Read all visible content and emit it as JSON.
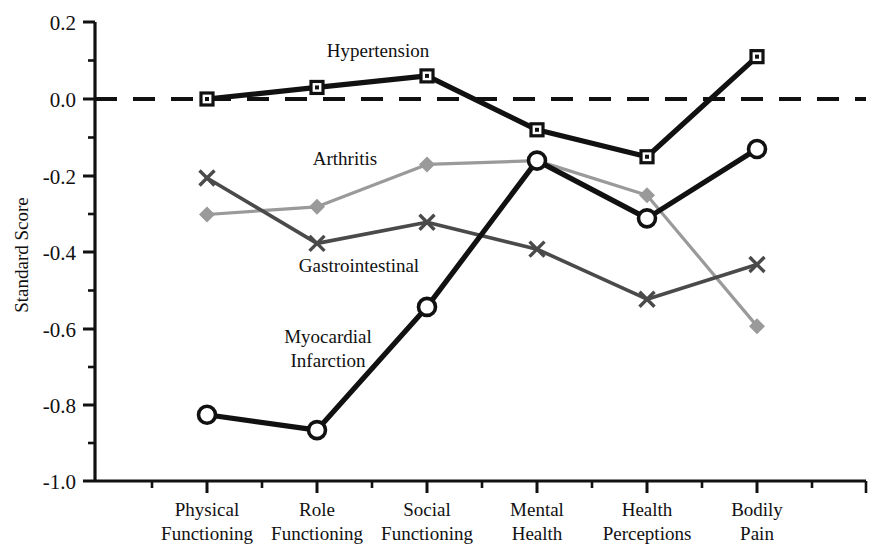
{
  "chart_data": {
    "type": "line",
    "title": "",
    "subtitle": "",
    "xlabel": "",
    "ylabel": "Standard Score",
    "ylim": [
      -1.0,
      0.2
    ],
    "ytick_labels": [
      "0.2",
      "0.0",
      "-0.2",
      "-0.4",
      "-0.6",
      "-0.8",
      "-1.0"
    ],
    "ytick_values": [
      0.2,
      0.0,
      -0.2,
      -0.4,
      -0.6,
      -0.8,
      -1.0
    ],
    "yminor_step": 0.05,
    "grid": false,
    "legend_position": "inline-annotations",
    "categories": [
      "Physical Functioning",
      "Role Functioning",
      "Social Functioning",
      "Mental Health",
      "Health Perceptions",
      "Bodily Pain"
    ],
    "category_lines": [
      [
        "Physical",
        "Functioning"
      ],
      [
        "Role",
        "Functioning"
      ],
      [
        "Social",
        "Functioning"
      ],
      [
        "Mental",
        "Health"
      ],
      [
        "Health",
        "Perceptions"
      ],
      [
        "Bodily",
        "Pain"
      ]
    ],
    "reference_line": {
      "value": 0.0,
      "style": "dashed",
      "color": "#111111"
    },
    "series": [
      {
        "name": "Hypertension",
        "marker": "square",
        "color": "#111111",
        "line_weight": "heavy",
        "values": [
          0.0,
          0.03,
          0.06,
          -0.08,
          -0.15,
          0.11
        ]
      },
      {
        "name": "Arthritis",
        "marker": "diamond",
        "color": "#9a9a9a",
        "line_weight": "light",
        "values": [
          -0.3,
          -0.28,
          -0.17,
          -0.16,
          -0.25,
          -0.59
        ]
      },
      {
        "name": "Gastrointestinal",
        "marker": "cross",
        "color": "#4a4a4a",
        "line_weight": "medium",
        "values": [
          -0.205,
          -0.375,
          -0.32,
          -0.39,
          -0.52,
          -0.43
        ]
      },
      {
        "name": "Myocardial Infarction",
        "marker": "circle",
        "color": "#111111",
        "line_weight": "heavy",
        "values": [
          -0.82,
          -0.86,
          -0.54,
          -0.16,
          -0.31,
          -0.13
        ]
      }
    ],
    "annotations": [
      {
        "text": "Hypertension",
        "series": "Hypertension"
      },
      {
        "text": "Arthritis",
        "series": "Arthritis"
      },
      {
        "text": "Gastrointestinal",
        "series": "Gastrointestinal"
      },
      {
        "text": "Myocardial",
        "series": "Myocardial Infarction"
      },
      {
        "text": "Infarction",
        "series": "Myocardial Infarction"
      }
    ]
  }
}
